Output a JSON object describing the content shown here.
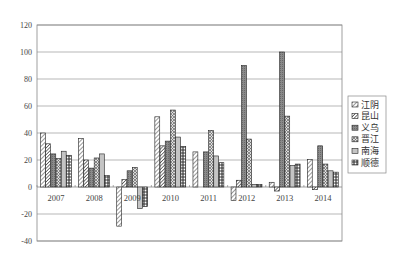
{
  "chart_data": {
    "type": "bar",
    "title": "",
    "xlabel": "",
    "ylabel": "",
    "ylim": [
      -40,
      120
    ],
    "yticks": [
      120,
      100,
      80,
      60,
      40,
      20,
      0,
      -20,
      -40
    ],
    "grid": true,
    "legend_position": "right",
    "categories": [
      "2007",
      "2008",
      "2009",
      "2010",
      "2011",
      "2012",
      "2013",
      "2014"
    ],
    "series": [
      {
        "name": "江阴",
        "pattern": "diagonal",
        "values": [
          40,
          36,
          -29,
          52,
          26,
          -10,
          3.5,
          20.5
        ]
      },
      {
        "name": "昆山",
        "pattern": "diagonal-dense",
        "values": [
          32,
          20,
          5.5,
          30.5,
          0,
          5,
          -3,
          -2
        ]
      },
      {
        "name": "义乌",
        "pattern": "dark-grey",
        "values": [
          24.5,
          14,
          12,
          34,
          26,
          90,
          100,
          30.5
        ]
      },
      {
        "name": "晋江",
        "pattern": "crosshatch",
        "values": [
          21,
          21.5,
          14.5,
          57,
          42,
          35.5,
          52.5,
          17
        ]
      },
      {
        "name": "南海",
        "pattern": "light-grey",
        "values": [
          26.5,
          24.5,
          -16,
          37,
          23,
          2,
          16,
          12
        ]
      },
      {
        "name": "顺德",
        "pattern": "dots",
        "values": [
          23.5,
          8.5,
          -14.5,
          30,
          18,
          2,
          17,
          11
        ]
      }
    ]
  },
  "legend": {
    "items": [
      "江阴",
      "昆山",
      "义乌",
      "晋江",
      "南海",
      "顺德"
    ]
  }
}
